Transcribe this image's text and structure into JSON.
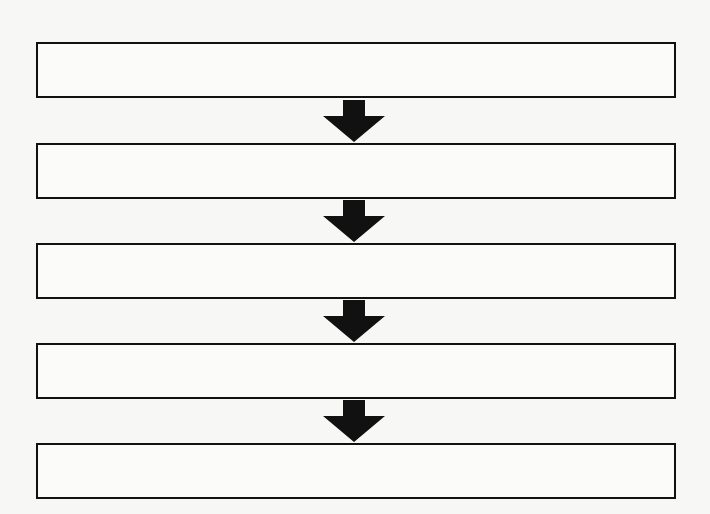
{
  "diagram": {
    "type": "vertical-flowchart",
    "steps": [
      {
        "label": ""
      },
      {
        "label": ""
      },
      {
        "label": ""
      },
      {
        "label": ""
      },
      {
        "label": ""
      }
    ],
    "arrow_count": 4,
    "colors": {
      "stroke": "#111111",
      "fill": "#fbfbfa",
      "background": "#f7f7f5"
    }
  }
}
